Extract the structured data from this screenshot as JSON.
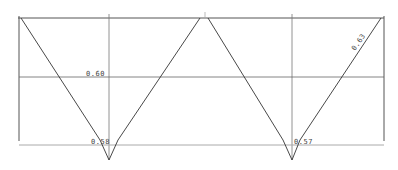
{
  "diagram": {
    "type": "line-diagram",
    "colors": {
      "frame": "#555555",
      "grid": "#666666",
      "baseline": "#aaaaaa",
      "curve": "#333333",
      "label": "#444444"
    },
    "labels": {
      "left_mid": "0.60",
      "left_bottom": "0.58",
      "right_bottom": "0.57",
      "right_slope": "0.63"
    },
    "shapes": [
      {
        "name": "left-v",
        "top_left": [
          19,
          18
        ],
        "bottom": [
          109,
          160
        ],
        "top_right": [
          205,
          18
        ]
      },
      {
        "name": "right-v",
        "top_left": [
          205,
          18
        ],
        "bottom": [
          292,
          160
        ],
        "top_right": [
          381,
          18
        ]
      }
    ]
  }
}
